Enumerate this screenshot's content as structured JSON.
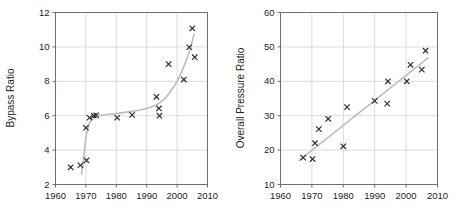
{
  "figure": {
    "background_color": "#ffffff",
    "marker_color": "#2b2b2b",
    "trend_color": "#bdbdbd",
    "grid_color": "#d2d2d2",
    "axis_color": "#6f6f6f",
    "marker_glyph": "x"
  },
  "chart_data": [
    {
      "type": "scatter",
      "title": "",
      "xlabel": "",
      "ylabel": "Bypass Ratio",
      "xlim": [
        1960,
        2010
      ],
      "ylim": [
        2,
        12
      ],
      "xticks": [
        1960,
        1970,
        1980,
        1990,
        2000,
        2010
      ],
      "yticks": [
        2,
        4,
        6,
        8,
        10,
        12
      ],
      "xtick_labels": [
        "1960",
        "1970",
        "1980",
        "1990",
        "2000",
        "2010"
      ],
      "ytick_labels": [
        "2",
        "4",
        "6",
        "8",
        "10",
        "12"
      ],
      "grid": true,
      "legend": false,
      "series": [
        {
          "name": "Bypass Ratio",
          "marker": "x",
          "points": [
            [
              1965.0,
              3.0
            ],
            [
              1968.2,
              3.12
            ],
            [
              1970.2,
              3.4
            ],
            [
              1970.0,
              5.3
            ],
            [
              1971.2,
              5.88
            ],
            [
              1972.6,
              6.0
            ],
            [
              1973.4,
              6.02
            ],
            [
              1980.3,
              5.88
            ],
            [
              1985.2,
              6.05
            ],
            [
              1993.2,
              7.1
            ],
            [
              1994.0,
              6.42
            ],
            [
              1994.2,
              6.0
            ],
            [
              1997.2,
              9.0
            ],
            [
              2002.2,
              8.1
            ],
            [
              2004.0,
              9.98
            ],
            [
              2005.0,
              11.08
            ],
            [
              2005.8,
              9.4
            ]
          ]
        }
      ],
      "trend": {
        "name": "trend-curve",
        "style": "s-curve",
        "points": [
          [
            1968.6,
            2.6
          ],
          [
            1969.2,
            3.45
          ],
          [
            1969.8,
            4.45
          ],
          [
            1970.6,
            5.25
          ],
          [
            1971.6,
            5.72
          ],
          [
            1973.0,
            5.95
          ],
          [
            1976.0,
            6.05
          ],
          [
            1980.0,
            6.12
          ],
          [
            1985.0,
            6.25
          ],
          [
            1989.0,
            6.38
          ],
          [
            1992.0,
            6.55
          ],
          [
            1994.0,
            6.72
          ],
          [
            1996.0,
            7.0
          ],
          [
            1998.0,
            7.45
          ],
          [
            2000.0,
            8.0
          ],
          [
            2002.0,
            8.75
          ],
          [
            2004.0,
            9.7
          ],
          [
            2005.6,
            10.75
          ]
        ]
      }
    },
    {
      "type": "scatter",
      "title": "",
      "xlabel": "",
      "ylabel": "Overall Pressure Ratio",
      "xlim": [
        1960,
        2010
      ],
      "ylim": [
        10,
        60
      ],
      "xticks": [
        1960,
        1970,
        1980,
        1990,
        2000,
        2010
      ],
      "yticks": [
        10,
        20,
        30,
        40,
        50,
        60
      ],
      "xtick_labels": [
        "1960",
        "1970",
        "1980",
        "1990",
        "2000",
        "2010"
      ],
      "ytick_labels": [
        "10",
        "20",
        "30",
        "40",
        "50",
        "60"
      ],
      "grid": true,
      "legend": false,
      "series": [
        {
          "name": "Overall Pressure Ratio",
          "marker": "x",
          "points": [
            [
              1967.2,
              17.8
            ],
            [
              1970.2,
              17.4
            ],
            [
              1971.0,
              22.0
            ],
            [
              1972.2,
              26.1
            ],
            [
              1975.2,
              29.1
            ],
            [
              1980.0,
              21.1
            ],
            [
              1981.2,
              32.5
            ],
            [
              1990.0,
              34.3
            ],
            [
              1994.0,
              33.5
            ],
            [
              1994.2,
              40.0
            ],
            [
              2000.2,
              40.0
            ],
            [
              2001.4,
              44.8
            ],
            [
              2005.0,
              43.4
            ],
            [
              2006.2,
              48.9
            ]
          ]
        }
      ],
      "trend": {
        "name": "trend-line",
        "style": "linear",
        "points": [
          [
            1966.0,
            17.0
          ],
          [
            2007.0,
            46.8
          ]
        ]
      }
    }
  ]
}
